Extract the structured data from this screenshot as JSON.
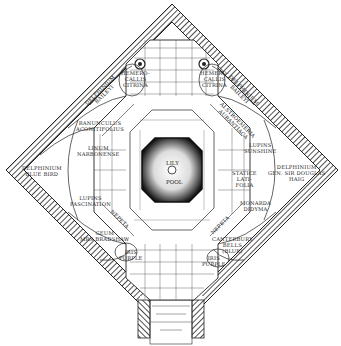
{
  "diagram": {
    "type": "garden-plan",
    "center": {
      "label_top": "LILY",
      "label_bottom": "POOL"
    },
    "beds": [
      {
        "id": "delphinium-belladonna",
        "label": "Delphinium\nBaileyi"
      },
      {
        "id": "hemerocallis-citrina-left",
        "label": "Hemero-\ncallis\nCitrina"
      },
      {
        "id": "hemerocallis-citrina-right",
        "label": "Hemero-\ncallis\nCitrina"
      },
      {
        "id": "delphinium-baileyi-right",
        "label": "Delphinium\nBaileyi"
      },
      {
        "id": "ranunculus",
        "label": "Ranunculus\nAconitifolius"
      },
      {
        "id": "alstroemeria",
        "label": "Alstroemeria\nAurantiaca"
      },
      {
        "id": "linum",
        "label": "Linum\nNarbonense"
      },
      {
        "id": "lupins-sunshine",
        "label": "Lupins\nSunshine"
      },
      {
        "id": "delphinium-blue-bird",
        "label": "Delphinium\nBlue Bird"
      },
      {
        "id": "delphinium-sir-douglas",
        "label": "Delphinium\nGen. Sir Douglas\nHaig"
      },
      {
        "id": "lupins-fascination",
        "label": "Lupins\nFascination"
      },
      {
        "id": "statice",
        "label": "Statice\nLati-\nfolia"
      },
      {
        "id": "nepeta-left",
        "label": "Nepeta"
      },
      {
        "id": "monarda",
        "label": "Monarda\nDidyma"
      },
      {
        "id": "geum",
        "label": "Geum\nMrs Bradshaw"
      },
      {
        "id": "nepeta-right",
        "label": "Nepeta"
      },
      {
        "id": "iris-purple-left",
        "label": "Iris\nPurple"
      },
      {
        "id": "campanula",
        "label": "Canterbury\nBells\n(Blue)"
      },
      {
        "id": "iris-purple-right",
        "label": "Iris\nPurple"
      }
    ],
    "colors": {
      "ink": "#222222",
      "pool": "#111111",
      "paper": "#ffffff"
    }
  }
}
